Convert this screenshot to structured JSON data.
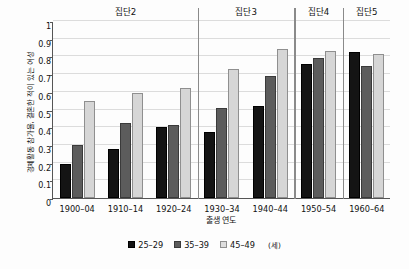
{
  "chart_data": {
    "type": "bar",
    "title": "",
    "subtitle": "",
    "xlabel": "출생 연도",
    "ylabel": "경제활동 참가율, 결혼한 적이 있는 여성",
    "categories": [
      "1900–04",
      "1910–14",
      "1920–24",
      "1930–34",
      "1940–44",
      "1950–54",
      "1960–64"
    ],
    "series": [
      {
        "name": "25–29",
        "color": "#141414",
        "values": [
          0.195,
          0.275,
          0.4,
          0.375,
          0.522,
          0.755,
          0.825
        ]
      },
      {
        "name": "35–39",
        "color": "#5c5c5c",
        "values": [
          0.298,
          0.421,
          0.41,
          0.506,
          0.69,
          0.79,
          0.744
        ]
      },
      {
        "name": "45–49",
        "color": "#d6d6d6",
        "values": [
          0.549,
          0.595,
          0.623,
          0.729,
          0.84,
          0.833,
          0.816
        ]
      }
    ],
    "ylim": [
      0,
      1
    ],
    "yticks": [
      "0",
      "0.1",
      "0.2",
      "0.3",
      "0.4",
      "0.5",
      "0.6",
      "0.7",
      "0.8",
      "0.9",
      "1"
    ],
    "ytick_values": [
      0,
      0.1,
      0.2,
      0.3,
      0.4,
      0.5,
      0.6,
      0.7,
      0.8,
      0.9,
      1
    ],
    "grid": true,
    "legend_position": "bottom",
    "legend_unit": "(세)",
    "cohorts": [
      {
        "label": "집단2",
        "start_index": 0,
        "end_index": 2
      },
      {
        "label": "집단3",
        "start_index": 3,
        "end_index": 4
      },
      {
        "label": "집단4",
        "start_index": 5,
        "end_index": 5
      },
      {
        "label": "집단5",
        "start_index": 6,
        "end_index": 6
      }
    ]
  }
}
